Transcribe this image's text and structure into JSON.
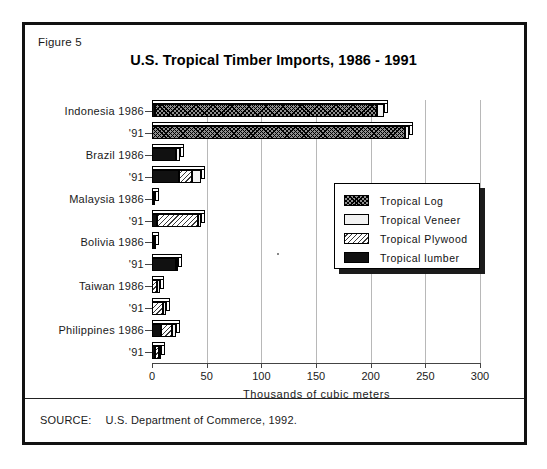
{
  "figure": {
    "label": "Figure 5",
    "title": "U.S. Tropical Timber Imports,  1986 - 1991",
    "source_label": "SOURCE:",
    "source_text": "U.S. Department of Commerce, 1992."
  },
  "legend": {
    "position": "inside-right-middle",
    "items": [
      {
        "label": "Tropical Log",
        "pattern": "fill-log",
        "color": "#8f8f8f"
      },
      {
        "label": "Tropical Veneer",
        "pattern": "fill-veneer",
        "color": "#f2f2f2"
      },
      {
        "label": "Tropical Plywood",
        "pattern": "fill-plywood",
        "color": "#ffffff"
      },
      {
        "label": "Tropical lumber",
        "pattern": "fill-lumber",
        "color": "#111111"
      }
    ]
  },
  "chart_data": {
    "type": "bar",
    "orientation": "horizontal",
    "stacked": true,
    "title": "U.S. Tropical Timber Imports,  1986 - 1991",
    "xlabel": "Thousands of cubic meters",
    "ylabel": "",
    "xlim": [
      0,
      300
    ],
    "xticks": [
      0,
      50,
      100,
      150,
      200,
      250,
      300
    ],
    "xtick_labels": [
      "0",
      "50",
      "100",
      "150",
      "200",
      "250",
      "300"
    ],
    "grid": "vertical",
    "legend_entries": [
      "Tropical Log",
      "Tropical Veneer",
      "Tropical Plywood",
      "Tropical lumber"
    ],
    "categories": [
      "Indonesia 1986",
      "'91",
      "Brazil 1986",
      "'91",
      "Malaysia 1986",
      "'91",
      "Bolivia 1986",
      "'91",
      "Taiwan 1986",
      "'91",
      "Philippines 1986",
      "'91"
    ],
    "series": [
      {
        "name": "Tropical lumber",
        "values": [
          3,
          0,
          22,
          25,
          1,
          5,
          2,
          22,
          0,
          0,
          8,
          3
        ]
      },
      {
        "name": "Tropical Log",
        "values": [
          203,
          231,
          0,
          0,
          0,
          0,
          0,
          0,
          0,
          0,
          0,
          0
        ]
      },
      {
        "name": "Tropical Plywood",
        "values": [
          0,
          0,
          0,
          12,
          0,
          37,
          0,
          0,
          5,
          10,
          10,
          3
        ]
      },
      {
        "name": "Tropical Veneer",
        "values": [
          6,
          4,
          4,
          8,
          2,
          3,
          1,
          2,
          2,
          3,
          4,
          2
        ]
      }
    ],
    "totals": [
      212,
      235,
      26,
      45,
      3,
      45,
      3,
      24,
      7,
      13,
      22,
      8
    ]
  }
}
